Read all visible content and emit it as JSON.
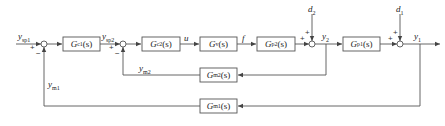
{
  "diagram": {
    "type": "cascade-control-block-diagram",
    "blocks": {
      "gc1": {
        "name": "G",
        "sub": "c1",
        "arg": "(s)"
      },
      "gc2": {
        "name": "G",
        "sub": "c2",
        "arg": "(s)"
      },
      "gv": {
        "name": "G",
        "sub": "v",
        "arg": "(s)"
      },
      "gp2": {
        "name": "G",
        "sub": "p2",
        "arg": "(s)"
      },
      "gp1": {
        "name": "G",
        "sub": "p1",
        "arg": "(s)"
      },
      "gm2": {
        "name": "G",
        "sub": "m2",
        "arg": "(s)"
      },
      "gm1": {
        "name": "G",
        "sub": "m1",
        "arg": "(s)"
      }
    },
    "signals": {
      "ysp1": {
        "base": "y",
        "sub": "sp1"
      },
      "ysp2": {
        "base": "y",
        "sub": "sp2"
      },
      "u": {
        "base": "u",
        "sub": ""
      },
      "f": {
        "base": "f",
        "sub": ""
      },
      "d2": {
        "base": "d",
        "sub": "2"
      },
      "d1": {
        "base": "d",
        "sub": "1"
      },
      "y2": {
        "base": "y",
        "sub": "2"
      },
      "y1": {
        "base": "y",
        "sub": "1"
      },
      "ym2": {
        "base": "y",
        "sub": "m2"
      },
      "ym1": {
        "base": "y",
        "sub": "m1"
      }
    },
    "signs": {
      "plus": "+",
      "minus": "−"
    }
  }
}
